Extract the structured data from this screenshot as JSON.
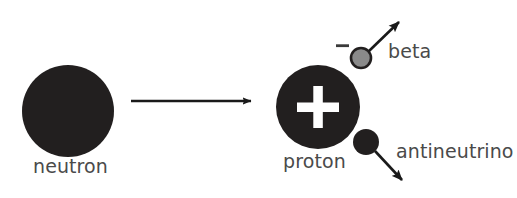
{
  "diagram": {
    "background_color": "#ffffff",
    "text_color": "#4a4a4a",
    "particle_dark_color": "#221f1f",
    "particle_gray_color": "#8a8a8a",
    "charge_symbol_color": "#ffffff",
    "arrow_color": "#1a1a1a",
    "reactant": {
      "name": "neutron",
      "label": "neutron",
      "charge_symbol": "",
      "fill": "#221f1f",
      "cx": 68,
      "cy": 111,
      "r": 46
    },
    "transform_arrow": {
      "name": "reaction-arrow",
      "x1": 131,
      "y1": 101,
      "x2": 255,
      "y2": 101
    },
    "products": [
      {
        "name": "proton",
        "label": "proton",
        "charge_symbol": "+",
        "fill": "#221f1f",
        "cx": 318,
        "cy": 107,
        "r": 42
      },
      {
        "name": "beta",
        "label": "beta",
        "charge_symbol": "−",
        "fill": "#8a8a8a",
        "cx": 361,
        "cy": 58,
        "r": 10,
        "arrow": {
          "x1": 368,
          "y1": 51,
          "x2": 404,
          "y2": 17
        }
      },
      {
        "name": "antineutrino",
        "label": "antineutrino",
        "charge_symbol": "",
        "fill": "#221f1f",
        "cx": 366,
        "cy": 142,
        "r": 13,
        "arrow": {
          "x1": 375,
          "y1": 151,
          "x2": 407,
          "y2": 185
        }
      }
    ]
  }
}
